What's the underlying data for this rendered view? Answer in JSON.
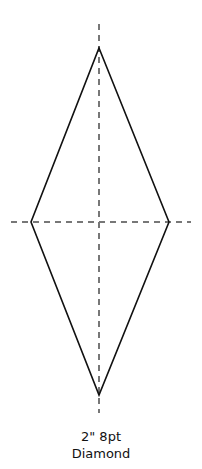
{
  "diagram": {
    "shape": "diamond",
    "stroke_color": "#111111",
    "guide_color": "#777777",
    "vertices": {
      "top": [
        99,
        48
      ],
      "right": [
        169,
        222
      ],
      "bottom": [
        99,
        395
      ],
      "left": [
        31,
        222
      ]
    },
    "vertical_guide": [
      99,
      24,
      99,
      413
    ],
    "horizontal_guide": [
      11,
      222,
      191,
      222
    ]
  },
  "caption": {
    "line1": "2\" 8pt",
    "line2": "Diamond"
  }
}
